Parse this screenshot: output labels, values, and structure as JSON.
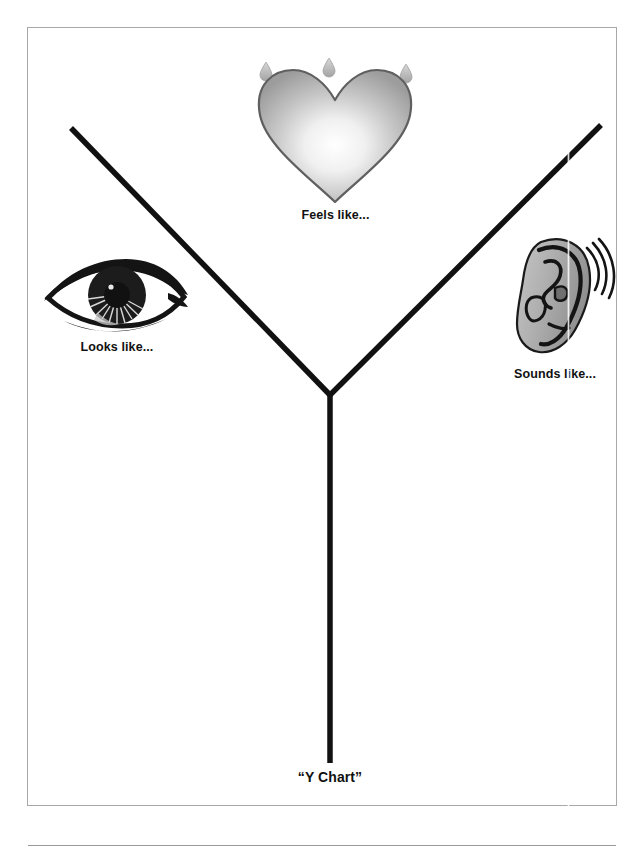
{
  "page": {
    "title": "“Y Chart”",
    "background_color": "#ffffff",
    "border_color": "#a8a8a8"
  },
  "diagram": {
    "type": "y-chart",
    "line_color": "#111111",
    "branches": [
      {
        "id": "left",
        "icon": "eye-icon",
        "label": "Looks like...",
        "from": [
          71,
          128
        ],
        "to": [
          330,
          395
        ]
      },
      {
        "id": "right",
        "icon": "ear-icon",
        "label": "Sounds like...",
        "from": [
          601,
          125
        ],
        "to": [
          330,
          395
        ]
      },
      {
        "id": "stem",
        "icon": "heart-icon",
        "label": "Feels like...",
        "from": [
          330,
          395
        ],
        "to": [
          330,
          763
        ]
      }
    ],
    "junction": [
      330,
      395
    ]
  },
  "icons": {
    "heart": {
      "name": "heart-icon",
      "outline_color": "#5a5a5a",
      "fill_center": "#ffffff",
      "fill_edge": "#9a9a9a",
      "droplet_count": 3,
      "droplet_color": "#b5b5b5"
    },
    "eye": {
      "name": "eye-icon",
      "color": "#1a1a1a"
    },
    "ear": {
      "name": "ear-icon",
      "outline_color": "#111111",
      "fill_color": "#b0b0b0",
      "wave_count": 3
    }
  },
  "labels": {
    "feels": "Feels like...",
    "looks": "Looks like...",
    "sounds": "Sounds like...",
    "title": "“Y Chart”"
  }
}
